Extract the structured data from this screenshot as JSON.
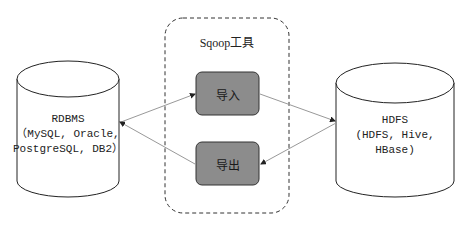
{
  "diagram": {
    "container": {
      "title": "Sqoop工具"
    },
    "left_store": {
      "title": "RDBMS",
      "line2": "（MySQL, Oracle,",
      "line3": "PostgreSQL, DB2）"
    },
    "right_store": {
      "title": "HDFS",
      "line2": "(HDFS, Hive,",
      "line3": "HBase)"
    },
    "import_box": {
      "label": "导入"
    },
    "export_box": {
      "label": "导出"
    },
    "edges": [
      {
        "from": "RDBMS",
        "to": "导入"
      },
      {
        "from": "导入",
        "to": "HDFS"
      },
      {
        "from": "HDFS",
        "to": "导出"
      },
      {
        "from": "导出",
        "to": "RDBMS"
      }
    ],
    "colors": {
      "process_fill": "#8c8c8c",
      "stroke": "#333333",
      "arrow": "#999999"
    }
  }
}
